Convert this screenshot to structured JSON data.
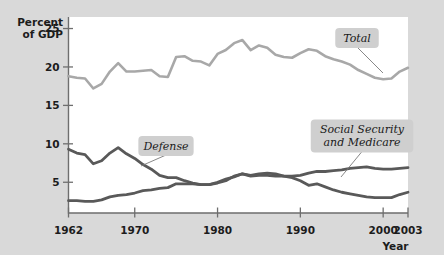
{
  "chart_data": {
    "type": "line",
    "title": "",
    "xlabel": "Year",
    "ylabel": "Percent of GDP",
    "ylabel_line1": "Percent",
    "ylabel_line2": "of GDP",
    "xlim": [
      1962,
      2003
    ],
    "ylim": [
      1.0,
      26.5
    ],
    "grid": false,
    "legend_position": "inline-callouts",
    "ytick_labels": [
      "25",
      "20",
      "15",
      "10",
      "5"
    ],
    "yticks": [
      25,
      20,
      15,
      10,
      5
    ],
    "xtick_labels": [
      "1962",
      "1970",
      "1980",
      "1990",
      "2000",
      "2003"
    ],
    "xticks": [
      1962,
      1970,
      1980,
      1990,
      2000,
      2003
    ],
    "x": [
      1962,
      1963,
      1964,
      1965,
      1966,
      1967,
      1968,
      1969,
      1970,
      1971,
      1972,
      1973,
      1974,
      1975,
      1976,
      1977,
      1978,
      1979,
      1980,
      1981,
      1982,
      1983,
      1984,
      1985,
      1986,
      1987,
      1988,
      1989,
      1990,
      1991,
      1992,
      1993,
      1994,
      1995,
      1996,
      1997,
      1998,
      1999,
      2000,
      2001,
      2002,
      2003
    ],
    "series": [
      {
        "name": "Total",
        "color": "#a8a8a8",
        "width": 2.6,
        "values": [
          18.8,
          18.6,
          18.5,
          17.2,
          17.8,
          19.4,
          20.5,
          19.4,
          19.4,
          19.5,
          19.6,
          18.8,
          18.7,
          21.3,
          21.4,
          20.8,
          20.7,
          20.2,
          21.7,
          22.2,
          23.1,
          23.5,
          22.2,
          22.8,
          22.5,
          21.6,
          21.3,
          21.2,
          21.8,
          22.3,
          22.1,
          21.4,
          21.0,
          20.7,
          20.3,
          19.6,
          19.1,
          18.6,
          18.4,
          18.5,
          19.4,
          19.9
        ]
      },
      {
        "name": "Defense",
        "color": "#595959",
        "width": 2.8,
        "values": [
          9.3,
          8.8,
          8.6,
          7.4,
          7.8,
          8.8,
          9.5,
          8.7,
          8.1,
          7.3,
          6.7,
          5.9,
          5.6,
          5.6,
          5.2,
          4.9,
          4.7,
          4.7,
          4.9,
          5.2,
          5.8,
          6.1,
          5.9,
          6.1,
          6.2,
          6.1,
          5.8,
          5.6,
          5.2,
          4.6,
          4.8,
          4.4,
          4.0,
          3.7,
          3.5,
          3.3,
          3.1,
          3.0,
          3.0,
          3.0,
          3.4,
          3.7
        ]
      },
      {
        "name": "Social Security and Medicare",
        "color": "#595959",
        "width": 2.8,
        "values": [
          2.6,
          2.6,
          2.5,
          2.5,
          2.7,
          3.1,
          3.3,
          3.4,
          3.6,
          3.9,
          4.0,
          4.2,
          4.3,
          4.8,
          4.8,
          4.8,
          4.7,
          4.7,
          5.0,
          5.4,
          5.7,
          6.1,
          5.8,
          5.9,
          5.9,
          5.8,
          5.8,
          5.8,
          5.9,
          6.2,
          6.4,
          6.4,
          6.5,
          6.6,
          6.8,
          6.9,
          7.0,
          6.8,
          6.7,
          6.7,
          6.8,
          6.9
        ]
      }
    ],
    "annotations": [
      {
        "label": "Total",
        "lines": [
          "Total"
        ],
        "box_x": 357,
        "box_y": 38,
        "anchor_x": 383,
        "anchor_y": 73
      },
      {
        "label": "Defense",
        "lines": [
          "Defense"
        ],
        "box_x": 166,
        "box_y": 146,
        "anchor_x": 141,
        "anchor_y": 166
      },
      {
        "label": "Social Security and Medicare",
        "lines": [
          "Social Security",
          "and Medicare"
        ],
        "box_x": 362,
        "box_y": 136,
        "anchor_x": 341,
        "anchor_y": 177
      }
    ]
  }
}
